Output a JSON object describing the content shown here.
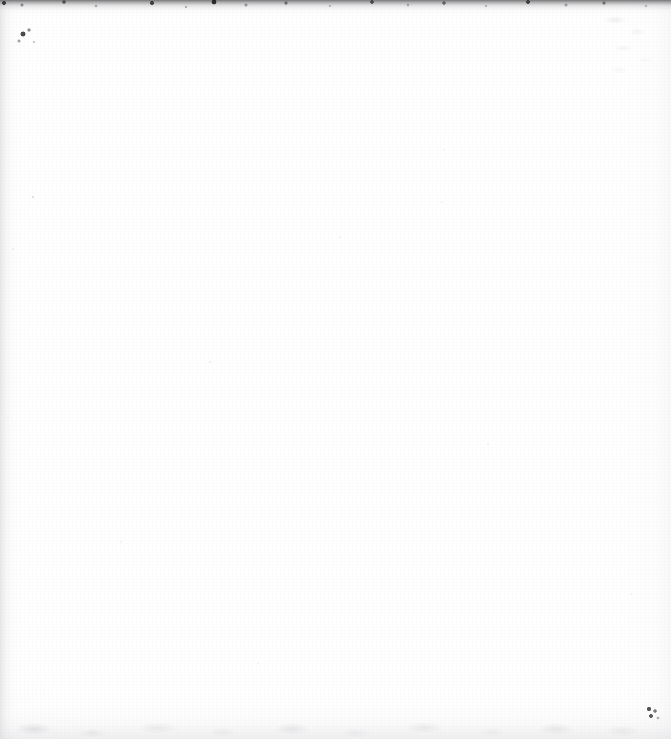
{
  "page": {
    "kind": "scanned-document-page",
    "width": 671,
    "height": 739,
    "body_text": "",
    "visible_text_lines": [],
    "background_color": "#ffffff",
    "paper_tone": "#fdfdfd"
  },
  "artifacts": {
    "top_edge": {
      "name": "dark ragged scan edge band",
      "color": "#464648",
      "height_px": 14,
      "has_speckles": true
    },
    "left_edge": {
      "name": "faint grey margin strip",
      "color": "#babac0",
      "width_px": 22
    },
    "right_edge": {
      "name": "faint grey margin mottle",
      "color": "#e4e4e8",
      "width_px": 46
    },
    "bottom_edge": {
      "name": "soft grey smudge band",
      "color": "#d6d6da",
      "height_px": 46
    },
    "specks": [
      {
        "name": "top-left ink speck cluster",
        "x": 14,
        "y": 24,
        "color": "#1c1c1e"
      },
      {
        "name": "bottom-right ink speck cluster",
        "x": 646,
        "y": 706,
        "color": "#28282b"
      },
      {
        "name": "left margin faint speck",
        "x": 32,
        "y": 196,
        "color": "#d8d8dc"
      },
      {
        "name": "mid-page faint speck",
        "x": 209,
        "y": 361,
        "color": "#ededf0"
      },
      {
        "name": "upper-right faint speck",
        "x": 441,
        "y": 201,
        "color": "#f0f0f2"
      },
      {
        "name": "top-right faint speck",
        "x": 443,
        "y": 149,
        "color": "#f2f2f4"
      },
      {
        "name": "centre faint speck",
        "x": 339,
        "y": 236,
        "color": "#f0f0f3"
      },
      {
        "name": "lower-left faint speck",
        "x": 120,
        "y": 541,
        "color": "#f1f1f4"
      },
      {
        "name": "lower-centre faint speck",
        "x": 257,
        "y": 662,
        "color": "#f2f2f5"
      },
      {
        "name": "right faint speck",
        "x": 487,
        "y": 443,
        "color": "#f1f1f3"
      },
      {
        "name": "right faint speck lower",
        "x": 630,
        "y": 593,
        "color": "#f2f2f4"
      },
      {
        "name": "left faint speck upper",
        "x": 12,
        "y": 248,
        "color": "#ededf1"
      },
      {
        "name": "left faint speck mid",
        "x": 7,
        "y": 416,
        "color": "#eeeef1"
      }
    ]
  }
}
